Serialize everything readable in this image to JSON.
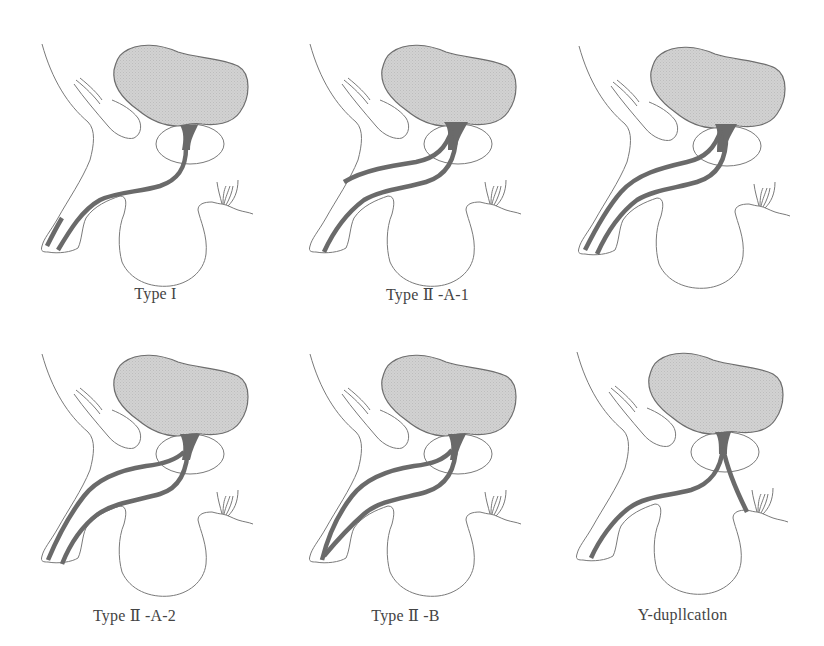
{
  "figure": {
    "panels": [
      {
        "id": "type-1",
        "label": "Type I",
        "variant": "type-1"
      },
      {
        "id": "type-2a1",
        "label": "Type II -A-1",
        "variant": "type-2a1"
      },
      {
        "id": "type-2a2",
        "label": "Type II -A-2",
        "variant": "type-2a2"
      },
      {
        "id": "type-2b",
        "label": "Type II -B",
        "variant": "type-2b"
      },
      {
        "id": "y-dup",
        "label": "Y-dupllcatlon",
        "variant": "y-duplication"
      }
    ],
    "panel_labels": [
      "Type I",
      "Type Ⅱ -A-1",
      "Type Ⅱ -A-2",
      "Type Ⅱ -B",
      "Y-dupllcatlon"
    ]
  },
  "colors": {
    "background": "#ffffff",
    "outline": "#7a7a7a",
    "bladder_fill": "#cfcfcf",
    "urethra": "#6a6a6a",
    "label_text": "#444444"
  }
}
